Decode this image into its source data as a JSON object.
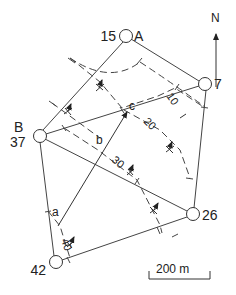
{
  "diagram": {
    "title": "",
    "stations": [
      {
        "id": "A",
        "label": "A",
        "height": "15",
        "x": 126,
        "y": 36
      },
      {
        "id": "7",
        "label": "",
        "height": "7",
        "x": 205,
        "y": 84
      },
      {
        "id": "B",
        "label": "B",
        "height": "37",
        "x": 40,
        "y": 136
      },
      {
        "id": "26",
        "label": "",
        "height": "26",
        "x": 193,
        "y": 214
      },
      {
        "id": "42",
        "label": "",
        "height": "42",
        "x": 56,
        "y": 262
      }
    ],
    "survey_lines": [
      [
        "A",
        "7"
      ],
      [
        "A",
        "B"
      ],
      [
        "7",
        "26"
      ],
      [
        "B",
        "7"
      ],
      [
        "B",
        "26"
      ],
      [
        "B",
        "42"
      ],
      [
        "42",
        "26"
      ]
    ],
    "contours": [
      {
        "value": "10",
        "label_x": 172,
        "label_y": 102,
        "rotate": 55
      },
      {
        "value": "20",
        "label_x": 148,
        "label_y": 126,
        "rotate": 45
      },
      {
        "value": "30",
        "label_x": 117,
        "label_y": 166,
        "rotate": 40
      },
      {
        "value": "40",
        "label_x": 64,
        "label_y": 252,
        "rotate": 65
      }
    ],
    "path_points": {
      "a": {
        "label": "a",
        "x": 57,
        "y": 218
      },
      "b": {
        "label": "b",
        "x": 100,
        "y": 140
      },
      "c": {
        "label": "c",
        "x": 128,
        "y": 108
      }
    },
    "north_arrow": {
      "label": "N"
    },
    "scale_bar": {
      "label": "200 m"
    },
    "stroke_color": "#333333"
  }
}
